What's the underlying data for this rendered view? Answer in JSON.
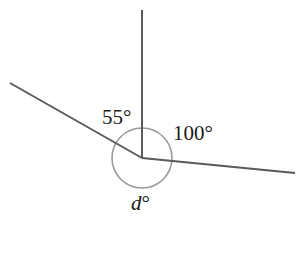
{
  "diagram": {
    "type": "angles-at-a-point",
    "vertex": {
      "x": 142,
      "y": 158
    },
    "rays": [
      {
        "name": "vertical-ray",
        "to": {
          "x": 142,
          "y": 10
        }
      },
      {
        "name": "left-ray",
        "to": {
          "x": 10,
          "y": 83
        }
      },
      {
        "name": "right-ray",
        "to": {
          "x": 295,
          "y": 173
        }
      }
    ],
    "arc_radius": 30,
    "labels": {
      "angle_left": "55°",
      "angle_right": "100°",
      "angle_reflex_var": "d",
      "angle_reflex_deg": "°"
    },
    "colors": {
      "ray": "#5a5a5a",
      "arc": "#9a9a9a",
      "text": "#1a1a1a",
      "background": "#ffffff"
    }
  }
}
